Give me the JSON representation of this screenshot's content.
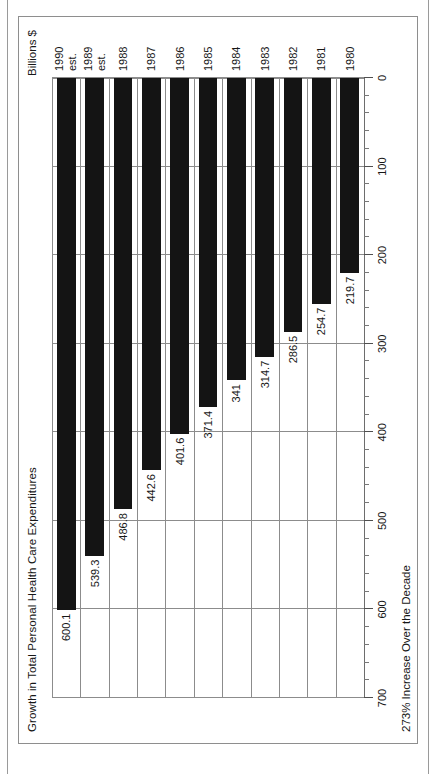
{
  "figure": {
    "title": "Growth in Total Personal Health Care Expenditures",
    "value_axis_title": "Billions $",
    "footnote": "273% Increase Over the Decade"
  },
  "chart_data": {
    "type": "bar",
    "orientation": "horizontal",
    "title": "Growth in Total Personal Health Care Expenditures",
    "xlabel": "Billions $",
    "ylabel": "",
    "annotations": [
      "273% Increase Over the Decade"
    ],
    "xlim": [
      0,
      700
    ],
    "xticks": [
      0,
      100,
      200,
      300,
      400,
      500,
      600,
      700
    ],
    "xtick_labels": [
      "0",
      "100",
      "200",
      "300",
      "400",
      "500",
      "600",
      "700"
    ],
    "minor_tick_interval": 20,
    "axis_reversed": true,
    "grid": true,
    "legend": "none",
    "bar_color": "#141414",
    "categories": [
      "1980",
      "1981",
      "1982",
      "1983",
      "1984",
      "1985",
      "1986",
      "1987",
      "1988",
      "1989 est.",
      "1990 est."
    ],
    "values": [
      219.7,
      254.7,
      286.5,
      314.7,
      341,
      371.4,
      401.6,
      442.6,
      486.8,
      539.3,
      600.1
    ],
    "value_labels": [
      "219.7",
      "254.7",
      "286.5",
      "314.7",
      "341",
      "371.4",
      "401.6",
      "442.6",
      "486.8",
      "539.3",
      "600.1"
    ],
    "bars": [
      {
        "category": "1980",
        "category_line1": "1980",
        "category_line2": "",
        "value": 219.7,
        "label": "219.7"
      },
      {
        "category": "1981",
        "category_line1": "1981",
        "category_line2": "",
        "value": 254.7,
        "label": "254.7"
      },
      {
        "category": "1982",
        "category_line1": "1982",
        "category_line2": "",
        "value": 286.5,
        "label": "286.5"
      },
      {
        "category": "1983",
        "category_line1": "1983",
        "category_line2": "",
        "value": 314.7,
        "label": "314.7"
      },
      {
        "category": "1984",
        "category_line1": "1984",
        "category_line2": "",
        "value": 341,
        "label": "341"
      },
      {
        "category": "1985",
        "category_line1": "1985",
        "category_line2": "",
        "value": 371.4,
        "label": "371.4"
      },
      {
        "category": "1986",
        "category_line1": "1986",
        "category_line2": "",
        "value": 401.6,
        "label": "401.6"
      },
      {
        "category": "1987",
        "category_line1": "1987",
        "category_line2": "",
        "value": 442.6,
        "label": "442.6"
      },
      {
        "category": "1988",
        "category_line1": "1988",
        "category_line2": "",
        "value": 486.8,
        "label": "486.8"
      },
      {
        "category": "1989 est.",
        "category_line1": "1989",
        "category_line2": "est.",
        "value": 539.3,
        "label": "539.3"
      },
      {
        "category": "1990 est.",
        "category_line1": "1990",
        "category_line2": "est.",
        "value": 600.1,
        "label": "600.1"
      }
    ]
  }
}
